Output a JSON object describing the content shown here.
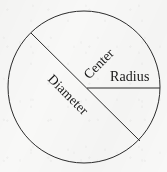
{
  "figure": {
    "background_color": "#f8f8f7",
    "stroke_color": "#2b2b2b",
    "text_color": "#161616",
    "width": 167,
    "height": 172
  },
  "labels": {
    "radius": "Radius",
    "center": "Center",
    "diameter": "Diameter"
  },
  "geometry": {
    "circle": {
      "center_x": 84,
      "center_y": 87,
      "radius": 76,
      "stroke_width": 1
    },
    "diameter_line": {
      "x1": 31,
      "y1": 33,
      "x2": 140,
      "y2": 141,
      "stroke_width": 1
    },
    "radius_line": {
      "x1": 87,
      "y1": 88,
      "x2": 160,
      "y2": 88,
      "stroke_width": 1
    }
  }
}
